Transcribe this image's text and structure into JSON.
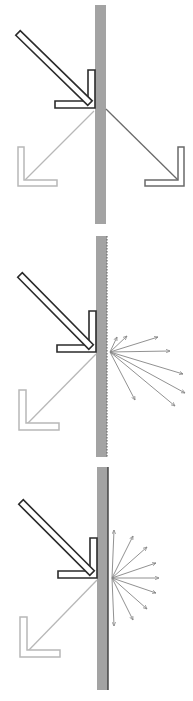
{
  "canvas": {
    "width": 193,
    "height": 701,
    "background": "#ffffff"
  },
  "colors": {
    "slab_fill": "#a3a3a3",
    "slab_edge_dark": "#3c3c3c",
    "slab_rough_edge": "#6e6e6e",
    "incident_stroke": "#2b2b2b",
    "incident_fill": "#ffffff",
    "reflected_stroke": "#b8b8b8",
    "transmitted_stroke": "#6a6a6a",
    "scatter_stroke": "#858585"
  },
  "panels": [
    {
      "id": "specular",
      "slab": {
        "x": 95,
        "y": 5,
        "width": 11,
        "height": 219,
        "edge": "none"
      },
      "incident": {
        "shaft_start": [
          18,
          33
        ],
        "tip": [
          95,
          108
        ],
        "head_vertical": {
          "x": 88,
          "y": 70,
          "w": 7,
          "h": 38
        },
        "head_horizontal": {
          "x": 55,
          "y": 101,
          "w": 40,
          "h": 7
        }
      },
      "reflected": {
        "from": [
          94,
          111
        ],
        "to": [
          25,
          180
        ],
        "head_vertical": {
          "x": 18,
          "y": 147,
          "w": 6,
          "h": 39
        },
        "head_horizontal": {
          "x": 18,
          "y": 180,
          "w": 39,
          "h": 6
        }
      },
      "transmitted": {
        "from": [
          106,
          109
        ],
        "to": [
          178,
          180
        ],
        "head_vertical": {
          "x": 178,
          "y": 147,
          "w": 6,
          "h": 39
        },
        "head_horizontal": {
          "x": 145,
          "y": 180,
          "w": 39,
          "h": 6
        }
      },
      "scatter": null
    },
    {
      "id": "rough-scatter",
      "slab": {
        "x": 96,
        "y": 236,
        "width": 11,
        "height": 221,
        "edge": "rough"
      },
      "incident": {
        "shaft_start": [
          20,
          275
        ],
        "tip": [
          96,
          352
        ],
        "head_vertical": {
          "x": 89,
          "y": 311,
          "w": 7,
          "h": 41
        },
        "head_horizontal": {
          "x": 57,
          "y": 345,
          "w": 39,
          "h": 7
        }
      },
      "reflected": {
        "from": [
          96,
          354
        ],
        "to": [
          27,
          424
        ],
        "head_vertical": {
          "x": 19,
          "y": 390,
          "w": 7,
          "h": 40
        },
        "head_horizontal": {
          "x": 19,
          "y": 423,
          "w": 40,
          "h": 7
        }
      },
      "transmitted": null,
      "scatter": {
        "origin": [
          110,
          352
        ],
        "rays": [
          [
            117,
            337
          ],
          [
            127,
            336
          ],
          [
            158,
            337
          ],
          [
            170,
            351
          ],
          [
            183,
            374
          ],
          [
            185,
            393
          ],
          [
            175,
            406
          ],
          [
            135,
            400
          ]
        ]
      }
    },
    {
      "id": "diffuse-lambertian",
      "slab": {
        "x": 97,
        "y": 467,
        "width": 11,
        "height": 223,
        "edge": "dark-line"
      },
      "incident": {
        "shaft_start": [
          21,
          502
        ],
        "tip": [
          97,
          578
        ],
        "head_vertical": {
          "x": 90,
          "y": 538,
          "w": 7,
          "h": 40
        },
        "head_horizontal": {
          "x": 58,
          "y": 571,
          "w": 39,
          "h": 7
        }
      },
      "reflected": {
        "from": [
          97,
          580
        ],
        "to": [
          28,
          651
        ],
        "head_vertical": {
          "x": 20,
          "y": 617,
          "w": 7,
          "h": 40
        },
        "head_horizontal": {
          "x": 20,
          "y": 650,
          "w": 40,
          "h": 7
        }
      },
      "transmitted": null,
      "scatter": {
        "origin": [
          112,
          578
        ],
        "rays": [
          [
            114,
            530
          ],
          [
            133,
            536
          ],
          [
            147,
            547
          ],
          [
            156,
            563
          ],
          [
            159,
            578
          ],
          [
            156,
            593
          ],
          [
            147,
            609
          ],
          [
            133,
            620
          ],
          [
            114,
            626
          ]
        ]
      }
    }
  ]
}
